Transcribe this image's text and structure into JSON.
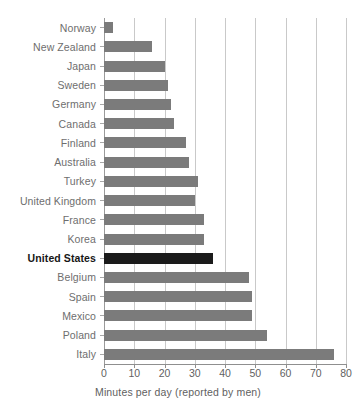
{
  "chart_data": {
    "type": "bar",
    "orientation": "horizontal",
    "title": "",
    "subtitle": "",
    "xlabel": "Minutes per day (reported by men)",
    "ylabel": "",
    "xlim": [
      0,
      80
    ],
    "xticks": [
      0,
      10,
      20,
      30,
      40,
      50,
      60,
      70,
      80
    ],
    "xtick_labels": [
      "0",
      "10",
      "20",
      "30",
      "40",
      "50",
      "60",
      "70",
      "80"
    ],
    "grid": "vertical",
    "legend": "none",
    "categories": [
      "Norway",
      "New Zealand",
      "Japan",
      "Sweden",
      "Germany",
      "Canada",
      "Finland",
      "Australia",
      "Turkey",
      "United Kingdom",
      "France",
      "Korea",
      "United States",
      "Belgium",
      "Spain",
      "Mexico",
      "Poland",
      "Italy"
    ],
    "values": [
      3,
      16,
      20,
      21,
      22,
      23,
      27,
      28,
      31,
      30,
      33,
      33,
      36,
      48,
      49,
      49,
      54,
      76
    ],
    "highlight_category": "United States",
    "colors": {
      "bar": "#7b7b7b",
      "bar_highlight": "#1b1b1b",
      "gridline": "#c9c9c9",
      "axis": "#8f8f8f",
      "label": "#6e6e6e",
      "label_highlight": "#161616",
      "background": "#ffffff"
    }
  }
}
